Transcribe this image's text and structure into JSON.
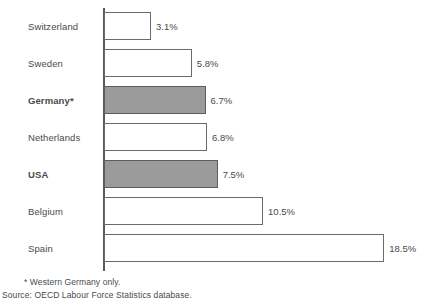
{
  "chart_data": {
    "type": "bar",
    "orientation": "horizontal",
    "title": "",
    "subtitle": "",
    "xlabel": "",
    "ylabel": "",
    "grid": false,
    "legend": null,
    "axis_visible": "y-axis-only",
    "xlim": [
      0,
      18.5
    ],
    "categories": [
      "Switzerland",
      "Sweden",
      "Germany*",
      "Netherlands",
      "USA",
      "Belgium",
      "Spain"
    ],
    "values": [
      3.1,
      5.8,
      6.7,
      6.8,
      7.5,
      10.5,
      18.5
    ],
    "value_labels": [
      "3.1%",
      "5.8%",
      "6.7%",
      "6.8%",
      "7.5%",
      "10.5%",
      "18.5%"
    ],
    "highlighted": [
      false,
      false,
      true,
      false,
      true,
      false,
      false
    ],
    "colors": {
      "bar_fill_default": "#ffffff",
      "bar_fill_highlight": "#9b9b9b",
      "bar_stroke": "#6b6b6b",
      "axis": "#5a5a5a",
      "text": "#4a4a4a",
      "background": "#ffffff"
    }
  },
  "bars": [
    {
      "category": "Switzerland",
      "value": 3.1,
      "label": "3.1%",
      "highlight": false
    },
    {
      "category": "Sweden",
      "value": 5.8,
      "label": "5.8%",
      "highlight": false
    },
    {
      "category": "Germany*",
      "value": 6.7,
      "label": "6.7%",
      "highlight": true
    },
    {
      "category": "Netherlands",
      "value": 6.8,
      "label": "6.8%",
      "highlight": false
    },
    {
      "category": "USA",
      "value": 7.5,
      "label": "7.5%",
      "highlight": true
    },
    {
      "category": "Belgium",
      "value": 10.5,
      "label": "10.5%",
      "highlight": false
    },
    {
      "category": "Spain",
      "value": 18.5,
      "label": "18.5%",
      "highlight": false
    }
  ],
  "footnotes": {
    "note": "* Western Germany only.",
    "source": "Source: OECD Labour Force Statistics database."
  }
}
